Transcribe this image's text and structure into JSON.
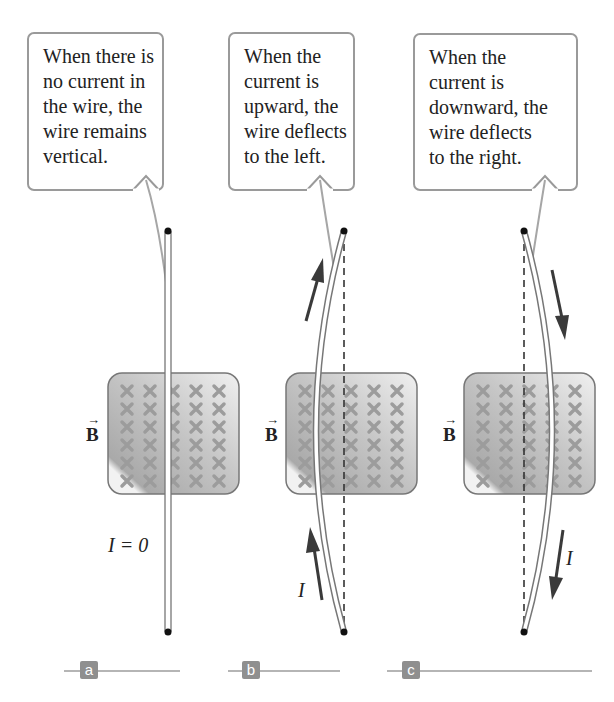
{
  "panels": [
    {
      "id": "a",
      "label": "a",
      "callout_lines": [
        "When there is",
        "no current in",
        "the wire, the",
        "wire remains",
        "vertical."
      ],
      "field_label": "B",
      "current_label": "I = 0",
      "wire_state": "vertical"
    },
    {
      "id": "b",
      "label": "b",
      "callout_lines": [
        "When the",
        "current is",
        "upward, the",
        "wire deflects",
        "to the left."
      ],
      "field_label": "B",
      "current_label": "I",
      "wire_state": "deflected-left",
      "current_direction": "up"
    },
    {
      "id": "c",
      "label": "c",
      "callout_lines": [
        "When the",
        "current is",
        "downward, the",
        "wire deflects",
        "to the right."
      ],
      "field_label": "B",
      "current_label": "I",
      "wire_state": "deflected-right",
      "current_direction": "down"
    }
  ],
  "field_symbol": "×",
  "field_grid": {
    "rows": 6,
    "cols": 5
  },
  "colors": {
    "callout_border": "#9a9a9a",
    "field_box": "#bdbdbd",
    "field_x": "#9c9c9c",
    "arrow": "#3a3a3a",
    "label_bg": "#8f8f8f"
  }
}
